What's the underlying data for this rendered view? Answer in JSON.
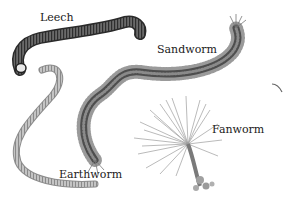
{
  "illustration": {
    "subject": "Types of annelid worms",
    "labels": [
      {
        "id": "leech",
        "text": "Leech"
      },
      {
        "id": "sandworm",
        "text": "Sandworm"
      },
      {
        "id": "fanworm",
        "text": "Fanworm"
      },
      {
        "id": "earthworm",
        "text": "Earthworm"
      }
    ],
    "colors": {
      "background": "#ffffff",
      "leech_body": "#4a4a4a",
      "sandworm_body": "#5c5c5c",
      "earthworm_body": "#a8a8a8",
      "fanworm_body": "#9a9a9a",
      "label_text": "#1a1a1a"
    }
  }
}
